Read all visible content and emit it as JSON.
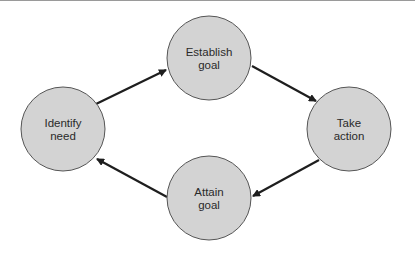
{
  "diagram": {
    "type": "cycle",
    "colors": {
      "node_fill": "#d3d3d3",
      "node_stroke": "#555555",
      "arrow": "#1e1e1e"
    },
    "nodes": [
      {
        "id": "identify",
        "line1": "Identify",
        "line2": "need"
      },
      {
        "id": "establish",
        "line1": "Establish",
        "line2": "goal"
      },
      {
        "id": "take",
        "line1": "Take",
        "line2": "action"
      },
      {
        "id": "attain",
        "line1": "Attain",
        "line2": "goal"
      }
    ],
    "edges": [
      {
        "from": "Identify need",
        "to": "Establish goal"
      },
      {
        "from": "Establish goal",
        "to": "Take action"
      },
      {
        "from": "Take action",
        "to": "Attain goal"
      },
      {
        "from": "Attain goal",
        "to": "Identify need"
      }
    ]
  }
}
